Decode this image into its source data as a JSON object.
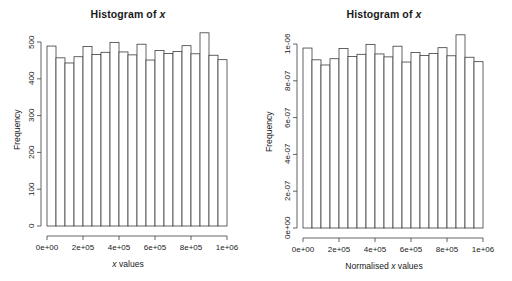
{
  "figure": {
    "background": "#ffffff",
    "ink": "#1a1a1a",
    "bar_fill": "#ffffff",
    "bar_stroke": "#3c3c3c",
    "axis_color": "#3c3c3c"
  },
  "panels": [
    {
      "id": "left",
      "title_prefix": "Histogram of ",
      "title_variable": "x",
      "xlabel_prefix": "",
      "xlabel_variable": "x",
      "xlabel_suffix": " values",
      "ylabel": "Frequency",
      "xticks": [
        "0e+00",
        "2e+05",
        "4e+05",
        "6e+05",
        "8e+05",
        "1e+06"
      ],
      "yticks": [
        "0",
        "100",
        "200",
        "300",
        "400",
        "500"
      ]
    },
    {
      "id": "right",
      "title_prefix": "Histogram of ",
      "title_variable": "x",
      "xlabel_prefix": "Normalised ",
      "xlabel_variable": "x",
      "xlabel_suffix": " values",
      "ylabel": "Frequency",
      "xticks": [
        "0e+00",
        "2e+05",
        "4e+05",
        "6e+05",
        "8e+05",
        "1e+06"
      ],
      "yticks": [
        "0e+00",
        "2e-07",
        "4e-07",
        "6e-07",
        "8e-07",
        "1e-06"
      ]
    }
  ],
  "chart_data": [
    {
      "type": "bar",
      "title": "Histogram of x",
      "xlabel": "x values",
      "ylabel": "Frequency",
      "xlim": [
        0,
        1000000
      ],
      "ylim": [
        0,
        500
      ],
      "bin_width": 50000,
      "bin_edges": [
        0,
        50000,
        100000,
        150000,
        200000,
        250000,
        300000,
        350000,
        400000,
        450000,
        500000,
        550000,
        600000,
        650000,
        700000,
        750000,
        800000,
        850000,
        900000,
        950000,
        1000000
      ],
      "xticks": [
        0,
        200000,
        400000,
        600000,
        800000,
        1000000
      ],
      "xticklabels": [
        "0e+00",
        "2e+05",
        "4e+05",
        "6e+05",
        "8e+05",
        "1e+06"
      ],
      "yticks": [
        0,
        100,
        200,
        300,
        400,
        500
      ],
      "yticklabels": [
        "0",
        "100",
        "200",
        "300",
        "400",
        "500"
      ],
      "values": [
        489,
        457,
        443,
        460,
        488,
        466,
        472,
        499,
        473,
        465,
        494,
        451,
        477,
        469,
        474,
        490,
        468,
        525,
        464,
        452,
        478
      ],
      "grid": false,
      "legend": null
    },
    {
      "type": "bar",
      "title": "Histogram of x",
      "xlabel": "Normalised x values",
      "ylabel": "Frequency",
      "xlim": [
        0,
        1000000
      ],
      "ylim": [
        0,
        1e-06
      ],
      "bin_width": 50000,
      "bin_edges": [
        0,
        50000,
        100000,
        150000,
        200000,
        250000,
        300000,
        350000,
        400000,
        450000,
        500000,
        550000,
        600000,
        650000,
        700000,
        750000,
        800000,
        850000,
        900000,
        950000,
        1000000
      ],
      "xticks": [
        0,
        200000,
        400000,
        600000,
        800000,
        1000000
      ],
      "xticklabels": [
        "0e+00",
        "2e+05",
        "4e+05",
        "6e+05",
        "8e+05",
        "1e+06"
      ],
      "yticks": [
        0,
        2e-07,
        4e-07,
        6e-07,
        8e-07,
        1e-06
      ],
      "yticklabels": [
        "0e+00",
        "2e-07",
        "4e-07",
        "6e-07",
        "8e-07",
        "1e-06"
      ],
      "values": [
        9.78e-07,
        9.14e-07,
        8.86e-07,
        9.2e-07,
        9.76e-07,
        9.32e-07,
        9.44e-07,
        9.98e-07,
        9.46e-07,
        9.3e-07,
        9.88e-07,
        9.02e-07,
        9.54e-07,
        9.38e-07,
        9.48e-07,
        9.8e-07,
        9.36e-07,
        1.05e-06,
        9.28e-07,
        9.04e-07,
        9.56e-07
      ],
      "grid": false,
      "legend": null
    }
  ]
}
